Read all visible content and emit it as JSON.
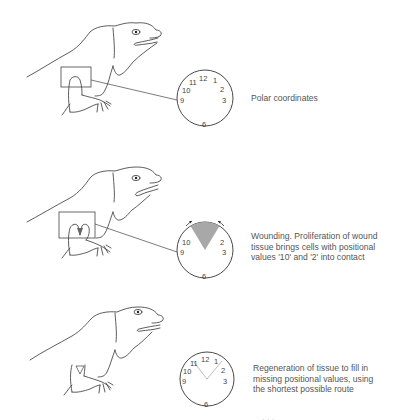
{
  "panels": [
    {
      "id": "normal",
      "caption": "Polar coordinates",
      "clock_labels": [
        "12",
        "1",
        "2",
        "3",
        "6",
        "9",
        "10",
        "11"
      ],
      "limb_state": "intact limb with boxed region"
    },
    {
      "id": "wounding",
      "caption_lines": [
        "Wounding. Proliferation of wound",
        "tissue brings cells with positional",
        "values '10' and '2' into contact"
      ],
      "clock_labels": [
        "2",
        "3",
        "6",
        "9",
        "10"
      ],
      "removed_sector": "11-12-1",
      "sector_color": "#a8a8a8",
      "limb_state": "limb with V-shaped wound"
    },
    {
      "id": "regeneration",
      "caption_lines": [
        "Regeneration of tissue to fill in",
        "missing positional values, using",
        "the shortest possible route"
      ],
      "clock_labels": [
        "12",
        "1",
        "2",
        "3",
        "6",
        "9",
        "10",
        "11"
      ],
      "regen_line_color": "#b5b5b5",
      "limb_state": "regenerated limb with small triangle"
    }
  ],
  "cutoff_text": "· · ·"
}
